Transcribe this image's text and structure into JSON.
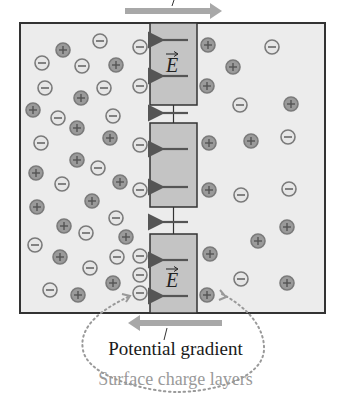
{
  "labels": {
    "field_symbol": "E",
    "potential_gradient": "Potential gradient",
    "surface_charge_layers": "Surface charge layers"
  },
  "colors": {
    "background": "#ffffff",
    "region_fill": "#ececec",
    "column_fill": "#c4c4c4",
    "border": "#333333",
    "arrow_gray": "#a8a8a8",
    "field_arrow": "#555555",
    "positive_fill": "#9a9a9a",
    "negative_fill": "#e6e6e6",
    "ion_stroke": "#7a7a7a",
    "dotted": "#999999",
    "subtitle": "#9a9a9a"
  },
  "layout": {
    "box": {
      "x": 20,
      "y": 23,
      "w": 305,
      "h": 290
    },
    "column": {
      "x": 150,
      "w": 47
    },
    "segments": [
      {
        "y": 23,
        "h": 82
      },
      {
        "y": 123,
        "h": 84
      },
      {
        "y": 234,
        "h": 79
      }
    ],
    "top_arrow": {
      "x1": 125,
      "x2": 222,
      "y": 11,
      "direction": "right"
    },
    "bottom_arrow": {
      "x1": 222,
      "x2": 128,
      "y": 323,
      "direction": "left"
    }
  },
  "field_arrows_y": [
    40,
    76,
    113,
    149,
    187,
    222,
    260,
    296
  ],
  "field_symbol_positions": [
    {
      "x": 172,
      "y": 66
    },
    {
      "x": 172,
      "y": 281
    }
  ],
  "ions": [
    {
      "x": 100,
      "y": 41,
      "charge": "-"
    },
    {
      "x": 63,
      "y": 50,
      "charge": "+"
    },
    {
      "x": 140,
      "y": 47,
      "charge": "-"
    },
    {
      "x": 42,
      "y": 63,
      "charge": "-"
    },
    {
      "x": 82,
      "y": 66,
      "charge": "-"
    },
    {
      "x": 116,
      "y": 65,
      "charge": "+"
    },
    {
      "x": 45,
      "y": 88,
      "charge": "-"
    },
    {
      "x": 104,
      "y": 88,
      "charge": "-"
    },
    {
      "x": 140,
      "y": 86,
      "charge": "-"
    },
    {
      "x": 81,
      "y": 98,
      "charge": "+"
    },
    {
      "x": 33,
      "y": 110,
      "charge": "+"
    },
    {
      "x": 58,
      "y": 118,
      "charge": "-"
    },
    {
      "x": 113,
      "y": 116,
      "charge": "-"
    },
    {
      "x": 77,
      "y": 128,
      "charge": "+"
    },
    {
      "x": 41,
      "y": 143,
      "charge": "-"
    },
    {
      "x": 110,
      "y": 138,
      "charge": "+"
    },
    {
      "x": 140,
      "y": 145,
      "charge": "-"
    },
    {
      "x": 77,
      "y": 160,
      "charge": "+"
    },
    {
      "x": 98,
      "y": 168,
      "charge": "-"
    },
    {
      "x": 36,
      "y": 173,
      "charge": "+"
    },
    {
      "x": 62,
      "y": 184,
      "charge": "-"
    },
    {
      "x": 120,
      "y": 182,
      "charge": "+"
    },
    {
      "x": 140,
      "y": 190,
      "charge": "-"
    },
    {
      "x": 37,
      "y": 207,
      "charge": "+"
    },
    {
      "x": 92,
      "y": 201,
      "charge": "+"
    },
    {
      "x": 116,
      "y": 218,
      "charge": "-"
    },
    {
      "x": 64,
      "y": 226,
      "charge": "+"
    },
    {
      "x": 86,
      "y": 233,
      "charge": "-"
    },
    {
      "x": 126,
      "y": 237,
      "charge": "+"
    },
    {
      "x": 35,
      "y": 245,
      "charge": "-"
    },
    {
      "x": 60,
      "y": 257,
      "charge": "+"
    },
    {
      "x": 117,
      "y": 257,
      "charge": "-"
    },
    {
      "x": 140,
      "y": 256,
      "charge": "-"
    },
    {
      "x": 90,
      "y": 268,
      "charge": "-"
    },
    {
      "x": 140,
      "y": 275,
      "charge": "-"
    },
    {
      "x": 113,
      "y": 283,
      "charge": "+"
    },
    {
      "x": 50,
      "y": 290,
      "charge": "-"
    },
    {
      "x": 78,
      "y": 295,
      "charge": "+"
    },
    {
      "x": 140,
      "y": 293,
      "charge": "-"
    },
    {
      "x": 208,
      "y": 45,
      "charge": "+"
    },
    {
      "x": 272,
      "y": 47,
      "charge": "-"
    },
    {
      "x": 233,
      "y": 67,
      "charge": "+"
    },
    {
      "x": 207,
      "y": 86,
      "charge": "+"
    },
    {
      "x": 240,
      "y": 105,
      "charge": "-"
    },
    {
      "x": 291,
      "y": 104,
      "charge": "+"
    },
    {
      "x": 209,
      "y": 143,
      "charge": "+"
    },
    {
      "x": 251,
      "y": 141,
      "charge": "+"
    },
    {
      "x": 288,
      "y": 137,
      "charge": "-"
    },
    {
      "x": 209,
      "y": 190,
      "charge": "+"
    },
    {
      "x": 241,
      "y": 195,
      "charge": "-"
    },
    {
      "x": 289,
      "y": 189,
      "charge": "-"
    },
    {
      "x": 287,
      "y": 227,
      "charge": "+"
    },
    {
      "x": 258,
      "y": 241,
      "charge": "+"
    },
    {
      "x": 210,
      "y": 254,
      "charge": "+"
    },
    {
      "x": 241,
      "y": 279,
      "charge": "-"
    },
    {
      "x": 287,
      "y": 283,
      "charge": "+"
    },
    {
      "x": 207,
      "y": 295,
      "charge": "+"
    }
  ]
}
